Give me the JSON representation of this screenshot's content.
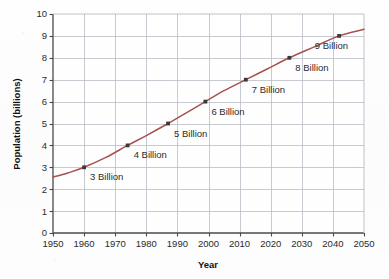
{
  "chart_data": {
    "type": "line",
    "title": "",
    "xlabel": "Year",
    "ylabel": "Population (billions)",
    "xlim": [
      1950,
      2050
    ],
    "ylim": [
      0,
      10
    ],
    "grid": true,
    "legend": "none",
    "xticks": [
      "1950",
      "1960",
      "1970",
      "1980",
      "1990",
      "2000",
      "2010",
      "2020",
      "2030",
      "2040",
      "2050"
    ],
    "yticks": [
      "0",
      "1",
      "2",
      "3",
      "4",
      "5",
      "6",
      "7",
      "8",
      "9",
      "10"
    ],
    "series": [
      {
        "name": "World population",
        "color": "#a8514f",
        "x": [
          1950,
          1955,
          1960,
          1967,
          1974,
          1980,
          1987,
          1993,
          1999,
          2005,
          2012,
          2019,
          2026,
          2034,
          2042,
          2050
        ],
        "y": [
          2.55,
          2.75,
          3.0,
          3.45,
          4.0,
          4.45,
          5.0,
          5.5,
          6.0,
          6.5,
          7.0,
          7.5,
          8.0,
          8.5,
          9.0,
          9.3
        ]
      }
    ],
    "annotations": [
      {
        "label": "3 Billion",
        "x": 1960,
        "y": 3,
        "marker": true
      },
      {
        "label": "4 Billion",
        "x": 1974,
        "y": 4,
        "marker": true
      },
      {
        "label": "5 Billion",
        "x": 1987,
        "y": 5,
        "marker": true
      },
      {
        "label": "6 Billion",
        "x": 1999,
        "y": 6,
        "marker": true
      },
      {
        "label": "7 Billion",
        "x": 2012,
        "y": 7,
        "marker": true
      },
      {
        "label": "8 Billion",
        "x": 2026,
        "y": 8,
        "marker": true
      },
      {
        "label": "9 Billion",
        "x": 2042,
        "y": 9,
        "marker": true
      }
    ],
    "colors": {
      "line": "#a8514f",
      "marker": "#3a3a3a",
      "grid": "#b9bcc4",
      "axis": "#4a4a4a",
      "text": "#2b2b2b",
      "background": "#fdfdfd"
    }
  },
  "labels": {
    "x_axis_title": "Year",
    "y_axis_title": "Population (billions)",
    "xticks": [
      "1950",
      "1960",
      "1970",
      "1980",
      "1990",
      "2000",
      "2010",
      "2020",
      "2030",
      "2040",
      "2050"
    ],
    "yticks": [
      "0",
      "1",
      "2",
      "3",
      "4",
      "5",
      "6",
      "7",
      "8",
      "9",
      "10"
    ],
    "points": [
      "3 Billion",
      "4 Billion",
      "5 Billion",
      "6 Billion",
      "7 Billion",
      "8 Billion",
      "9 Billion"
    ]
  }
}
